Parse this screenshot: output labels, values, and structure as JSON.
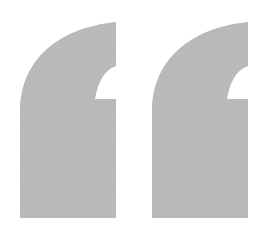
{
  "icon": {
    "name": "opening-quotation-mark",
    "label": "“",
    "fill_color": "#b3b3b3",
    "background_color": "#ffffff",
    "texture": "grain",
    "marks": [
      {
        "id": "left-mark",
        "left": 20,
        "right": 116,
        "top": 22,
        "notch_y": 99,
        "notch_x": 95,
        "bottom": 218
      },
      {
        "id": "right-mark",
        "left": 150,
        "right": 248,
        "top": 22,
        "notch_y": 99,
        "notch_x": 228,
        "bottom": 218
      }
    ]
  }
}
